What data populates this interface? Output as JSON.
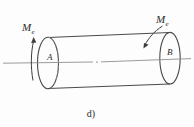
{
  "figure": {
    "caption": "d)",
    "background_color": "#fdfdfd",
    "line_color": "#4a4a4a",
    "axis_color": "#8f8f8f",
    "hidden_line_color": "#8a8a8a",
    "label_color": "#2b2b2b"
  },
  "labels": {
    "moment_left": {
      "symbol": "M",
      "subscript": "e",
      "full": "Me"
    },
    "moment_right": {
      "symbol": "M",
      "subscript": "e",
      "full": "Me"
    },
    "node_left": "A",
    "node_right": "B"
  },
  "diagram_data": {
    "type": "engineering-sketch",
    "subject": "circular shaft in pure torsion",
    "elements": [
      "left end cross-section A",
      "right end cross-section B",
      "longitudinal axis centerline",
      "applied torque Me at left end",
      "applied torque Me at right end"
    ]
  }
}
